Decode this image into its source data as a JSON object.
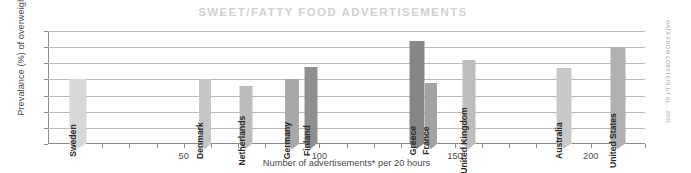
{
  "chart_data": {
    "type": "bar",
    "title": "SWEET/FATTY FOOD ADVERTISEMENTS",
    "xlabel": "Number of advertisements* per 20 hours",
    "ylabel": "Prevalance (%) of overweight",
    "xlim": [
      0,
      220
    ],
    "ylim": [
      0,
      35
    ],
    "yticks": [
      0,
      5,
      10,
      15,
      20,
      25,
      30,
      35
    ],
    "xticks": [
      50,
      100,
      150,
      200
    ],
    "xtick_labels": [
      "50",
      "100",
      "150",
      "200"
    ],
    "ytick_labels": [
      "0",
      "5",
      "10",
      "15",
      "20",
      "25",
      "30",
      "35"
    ],
    "grid": "horizontal",
    "legend": "none",
    "annotation": "DATA FROM LOBSTEIN ET AL., 2005.",
    "xlabel_note": "* advertisements",
    "points": [
      {
        "label": "Sweden",
        "x": 11,
        "y": 20,
        "color": "#d8d8d8",
        "width": 17
      },
      {
        "label": "Denmark",
        "x": 58,
        "y": 20,
        "color": "#c6c6c6",
        "width": 12
      },
      {
        "label": "Netherlands",
        "x": 73,
        "y": 18,
        "color": "#bcbcbc",
        "width": 13
      },
      {
        "label": "Germany",
        "x": 90,
        "y": 20,
        "color": "#a8a8a8",
        "width": 14
      },
      {
        "label": "Finland",
        "x": 97,
        "y": 24,
        "color": "#8f8f8f",
        "width": 13
      },
      {
        "label": "Greece",
        "x": 136,
        "y": 32,
        "color": "#878787",
        "width": 15
      },
      {
        "label": "France",
        "x": 141,
        "y": 19,
        "color": "#a3a3a3",
        "width": 12
      },
      {
        "label": "United Kingdom",
        "x": 155,
        "y": 26,
        "color": "#bdbdbd",
        "width": 13
      },
      {
        "label": "Australia",
        "x": 190,
        "y": 23.5,
        "color": "#c9c9c9",
        "width": 15
      },
      {
        "label": "United States",
        "x": 210,
        "y": 30,
        "color": "#b0b0b0",
        "width": 15
      }
    ]
  }
}
